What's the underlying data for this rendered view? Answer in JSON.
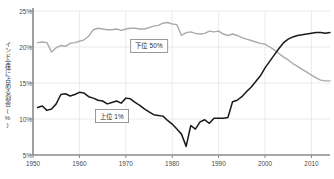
{
  "chart_data": {
    "type": "line",
    "title": "",
    "xlabel": "",
    "ylabel": "インド全体に占める割合(%)",
    "xlim": [
      1950,
      2014
    ],
    "ylim": [
      5,
      25
    ],
    "grid": true,
    "legend_position": "inline-labels",
    "yticks": [
      "5%",
      "10%",
      "15%",
      "20%",
      "25%"
    ],
    "ytick_values": [
      5,
      10,
      15,
      20,
      25
    ],
    "xticks": [
      "1950",
      "1960",
      "1970",
      "1980",
      "1990",
      "2000",
      "2010"
    ],
    "xtick_values": [
      1950,
      1960,
      1970,
      1980,
      1990,
      2000,
      2010
    ],
    "series": [
      {
        "name": "下位 50%",
        "color": "#aaaaaa",
        "label_x": 1975,
        "label_y": 20.2,
        "x": [
          1951,
          1952,
          1953,
          1954,
          1955,
          1956,
          1957,
          1958,
          1959,
          1960,
          1961,
          1962,
          1963,
          1964,
          1965,
          1966,
          1967,
          1968,
          1969,
          1970,
          1971,
          1972,
          1973,
          1974,
          1975,
          1976,
          1977,
          1978,
          1979,
          1980,
          1981,
          1982,
          1983,
          1984,
          1985,
          1986,
          1987,
          1988,
          1989,
          1990,
          1991,
          1992,
          1993,
          1994,
          1995,
          1996,
          1997,
          1998,
          1999,
          2000,
          2001,
          2002,
          2003,
          2004,
          2005,
          2006,
          2007,
          2008,
          2009,
          2010,
          2011,
          2012,
          2013,
          2014
        ],
        "values": [
          20.6,
          20.7,
          20.6,
          19.3,
          19.9,
          20.2,
          20.1,
          20.5,
          20.6,
          20.8,
          21.0,
          21.5,
          22.4,
          22.6,
          22.5,
          22.4,
          22.4,
          22.5,
          22.3,
          22.5,
          22.6,
          22.6,
          22.5,
          22.5,
          22.7,
          22.9,
          23.0,
          23.3,
          23.4,
          23.2,
          23.1,
          21.6,
          22.0,
          22.1,
          21.9,
          21.8,
          21.9,
          22.2,
          22.1,
          22.2,
          21.8,
          21.6,
          21.8,
          21.6,
          21.3,
          21.1,
          20.9,
          20.7,
          20.5,
          20.4,
          20.0,
          19.6,
          19.1,
          18.6,
          18.2,
          17.7,
          17.3,
          16.9,
          16.5,
          16.1,
          15.7,
          15.4,
          15.3,
          15.3
        ]
      },
      {
        "name": "上位 1%",
        "color": "#1a1a1a",
        "label_x": 1967,
        "label_y": 10.4,
        "x": [
          1951,
          1952,
          1953,
          1954,
          1955,
          1956,
          1957,
          1958,
          1959,
          1960,
          1961,
          1962,
          1963,
          1964,
          1965,
          1966,
          1967,
          1968,
          1969,
          1970,
          1971,
          1972,
          1973,
          1974,
          1975,
          1976,
          1977,
          1978,
          1979,
          1980,
          1981,
          1982,
          1983,
          1984,
          1985,
          1986,
          1987,
          1988,
          1989,
          1990,
          1991,
          1992,
          1993,
          1994,
          1995,
          1996,
          1997,
          1998,
          1999,
          2000,
          2001,
          2002,
          2003,
          2004,
          2005,
          2006,
          2007,
          2008,
          2009,
          2010,
          2011,
          2012,
          2013,
          2014
        ],
        "values": [
          11.6,
          11.8,
          11.2,
          11.4,
          12.1,
          13.4,
          13.5,
          13.2,
          13.4,
          13.7,
          13.6,
          13.1,
          12.9,
          12.6,
          12.5,
          12.1,
          12.3,
          12.5,
          12.2,
          12.9,
          12.8,
          12.3,
          11.9,
          11.4,
          11.0,
          10.6,
          10.5,
          10.4,
          9.8,
          9.3,
          8.6,
          7.9,
          6.2,
          9.1,
          8.6,
          9.6,
          9.9,
          9.4,
          10.1,
          10.1,
          10.1,
          10.2,
          12.4,
          12.6,
          13.1,
          13.8,
          14.4,
          15.2,
          16.0,
          17.1,
          18.0,
          18.9,
          19.8,
          20.6,
          21.1,
          21.4,
          21.6,
          21.7,
          21.8,
          21.9,
          22.0,
          22.0,
          21.9,
          22.0
        ]
      }
    ]
  }
}
